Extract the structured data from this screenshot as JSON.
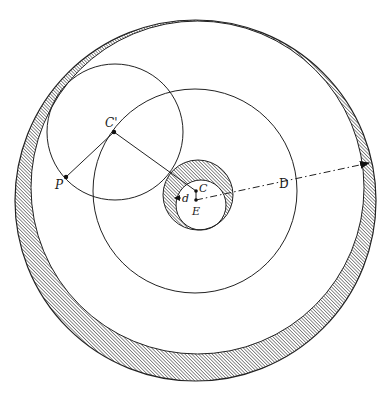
{
  "diagram": {
    "colors": {
      "background": "#ffffff",
      "stroke": "#222222",
      "hatch": "#333333"
    },
    "labels": {
      "epicycle_center": "C'",
      "planet": "P",
      "deferent_center": "C",
      "equant_or_earth": "E",
      "small_distance": "d",
      "large_distance": "D"
    },
    "shapes": {
      "outer_ring": {
        "outer": {
          "cx": 195.5,
          "cy": 200.5,
          "r": 180.5
        },
        "inner": {
          "cx": 197.5,
          "cy": 187.5,
          "r": 166.5
        }
      },
      "deferent": {
        "cx": 195,
        "cy": 191,
        "r": 102
      },
      "epicycle": {
        "cx": 115,
        "cy": 132,
        "r": 68
      },
      "hub": {
        "outer": {
          "cx": 198,
          "cy": 195,
          "r": 35
        },
        "inner": {
          "cx": 201,
          "cy": 205,
          "r": 25
        }
      },
      "points": {
        "C_prime": {
          "x": 114,
          "y": 132
        },
        "P": {
          "x": 66,
          "y": 177
        },
        "C": {
          "x": 196,
          "y": 191
        },
        "E": {
          "x": 196,
          "y": 200
        },
        "D_arrow_tip": {
          "x": 369,
          "y": 163
        }
      }
    }
  }
}
